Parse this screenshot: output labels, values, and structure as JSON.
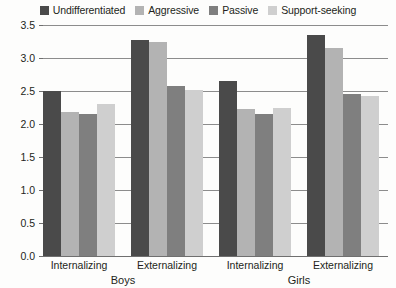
{
  "chart_data": {
    "type": "bar",
    "title": "",
    "xlabel": "",
    "ylabel": "",
    "ylim": [
      0.0,
      3.5
    ],
    "ytick_labels": [
      "0.0",
      "0.5",
      "1.0",
      "1.5",
      "2.0",
      "2.5",
      "3.0",
      "3.5"
    ],
    "ytick_values": [
      0.0,
      0.5,
      1.0,
      1.5,
      2.0,
      2.5,
      3.0,
      3.5
    ],
    "grid": true,
    "legend_position": "top",
    "categories": [
      "Internalizing",
      "Externalizing",
      "Internalizing",
      "Externalizing"
    ],
    "supergroups": [
      "Boys",
      "Girls"
    ],
    "series": [
      {
        "name": "Undifferentiated",
        "color": "#4a4a4a",
        "values": [
          2.5,
          3.28,
          2.65,
          3.35
        ]
      },
      {
        "name": "Aggressive",
        "color": "#b3b3b3",
        "values": [
          2.18,
          3.25,
          2.23,
          3.15
        ]
      },
      {
        "name": "Passive",
        "color": "#7f7f7f",
        "values": [
          2.15,
          2.58,
          2.15,
          2.45
        ]
      },
      {
        "name": "Support-seeking",
        "color": "#cfcfcf",
        "values": [
          2.3,
          2.52,
          2.25,
          2.42
        ]
      }
    ]
  },
  "legend": {
    "items": [
      {
        "label": "Undifferentiated",
        "swatch": "legend-swatch-undifferentiated"
      },
      {
        "label": "Aggressive",
        "swatch": "legend-swatch-aggressive"
      },
      {
        "label": "Passive",
        "swatch": "legend-swatch-passive"
      },
      {
        "label": "Support-seeking",
        "swatch": "legend-swatch-support-seeking"
      }
    ]
  },
  "axis": {
    "line_color": "#6f6f6f",
    "grid_color": "#8c8c8c"
  }
}
